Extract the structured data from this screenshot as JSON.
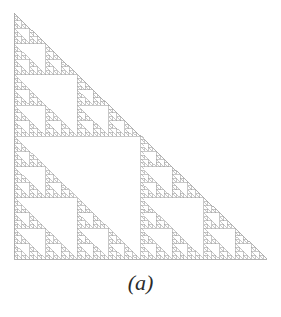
{
  "figure": {
    "caption": "(a)",
    "alt_label": "sierpinski-right-triangle-gasket"
  },
  "chart_data": {
    "type": "fractal-diagram",
    "name": "Sierpinski right triangle (gasket)",
    "title": "",
    "subtitle": "",
    "xlabel": "",
    "ylabel": "",
    "caption": "(a)",
    "grid": false,
    "legend": null,
    "recursion_depth": 6,
    "subdivision_rule": "each right triangle splits into 4 half-scale right triangles; the middle (inverted) one is removed, leaving top-left, bottom-left and bottom-right",
    "self_similar_copies_per_level": 3,
    "scale_factor": 0.5,
    "hausdorff_dimension": 1.585,
    "orientation": "right-angle at bottom-left, hypotenuse from top-left apex to bottom-right vertex",
    "vertices_px": {
      "apex": [
        14,
        13
      ],
      "bottom_left": [
        14,
        259
      ],
      "bottom_right": [
        267,
        259
      ]
    },
    "bounding_box_px": {
      "x": 14,
      "y": 13,
      "width": 253,
      "height": 246
    },
    "smallest_triangle_leg_px": 3.9,
    "triangle_count_at_depth": [
      1,
      3,
      9,
      27,
      81,
      243,
      729
    ],
    "colors": {
      "stroke": "#a3a3a3",
      "fill": "#ffffff",
      "background": "#ffffff",
      "caption": "#2b2b2b"
    },
    "stroke_width_px": 0.6
  }
}
